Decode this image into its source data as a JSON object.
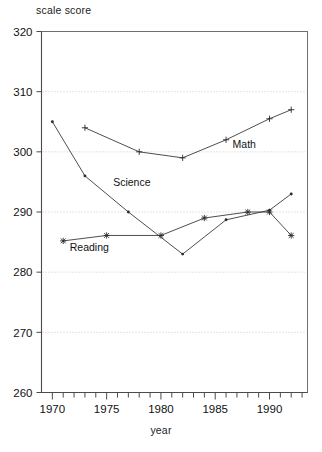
{
  "chart_data": {
    "type": "line",
    "title": "",
    "xlabel": "year",
    "ylabel": "scale score",
    "xlim": [
      1969,
      1993.5
    ],
    "ylim": [
      260,
      320
    ],
    "yticks": [
      260,
      270,
      280,
      290,
      300,
      310,
      320
    ],
    "ytick_labels": [
      "260",
      "270",
      "280",
      "290",
      "300",
      "310",
      "320"
    ],
    "xticks": [
      1970,
      1975,
      1980,
      1985,
      1990
    ],
    "xtick_labels": [
      "1970",
      "1975",
      "1980",
      "1985",
      "1990"
    ],
    "x_minor_tick_step": 1,
    "grid": "horizontal-dotted",
    "legend_position": "inline-annotations",
    "series": [
      {
        "name": "Math",
        "marker": "plus",
        "label_x": 1986.6,
        "label_y": 300.6,
        "points": [
          {
            "x": 1973,
            "y": 304
          },
          {
            "x": 1978,
            "y": 300
          },
          {
            "x": 1982,
            "y": 299
          },
          {
            "x": 1986,
            "y": 302
          },
          {
            "x": 1990,
            "y": 305.5
          },
          {
            "x": 1992,
            "y": 307
          }
        ]
      },
      {
        "name": "Science",
        "marker": "dot",
        "label_x": 1975.6,
        "label_y": 294.3,
        "points": [
          {
            "x": 1970,
            "y": 305
          },
          {
            "x": 1973,
            "y": 296
          },
          {
            "x": 1977,
            "y": 290
          },
          {
            "x": 1982,
            "y": 283
          },
          {
            "x": 1986,
            "y": 288.7
          },
          {
            "x": 1990,
            "y": 290.3
          },
          {
            "x": 1992,
            "y": 293
          }
        ]
      },
      {
        "name": "Reading",
        "marker": "cross",
        "label_x": 1971.6,
        "label_y": 283.6,
        "points": [
          {
            "x": 1971,
            "y": 285.2
          },
          {
            "x": 1975,
            "y": 286.1
          },
          {
            "x": 1980,
            "y": 286.1
          },
          {
            "x": 1984,
            "y": 289
          },
          {
            "x": 1988,
            "y": 290
          },
          {
            "x": 1990,
            "y": 290
          },
          {
            "x": 1992,
            "y": 286.1
          }
        ]
      }
    ],
    "colors": {
      "line": "#3a3a3a",
      "grid": "#bdbdbd",
      "frame": "#6e6e6e",
      "text": "#111111",
      "background": "#ffffff"
    }
  }
}
